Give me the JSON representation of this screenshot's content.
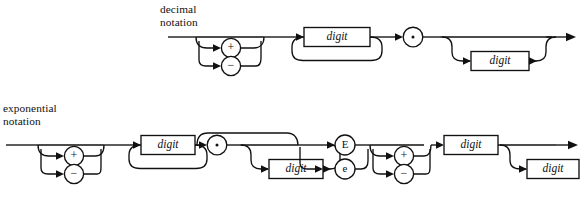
{
  "figure": {
    "type": "railroad-syntax-diagram",
    "line_color": "#111111",
    "background": "#ffffff"
  },
  "diagrams": [
    {
      "id": "decimal",
      "caption": "decimal\nnotation",
      "caption_line1": "decimal",
      "caption_line2": "notation",
      "elements": [
        {
          "kind": "optional-choice",
          "name": "sign",
          "options": [
            "+",
            "−"
          ]
        },
        {
          "kind": "repeat-box",
          "name": "integer-digits",
          "label": "digit",
          "loop": "below"
        },
        {
          "kind": "terminal-circle",
          "name": "decimal-point",
          "label": "·"
        },
        {
          "kind": "optional-repeat-box",
          "name": "fraction-digits",
          "label": "digit",
          "loop": "around"
        }
      ]
    },
    {
      "id": "exponential",
      "caption": "exponential\nnotation",
      "caption_line1": "exponential",
      "caption_line2": "notation",
      "elements": [
        {
          "kind": "optional-choice",
          "name": "mantissa-sign",
          "options": [
            "+",
            "−"
          ]
        },
        {
          "kind": "repeat-box",
          "name": "mantissa-integer-digits",
          "label": "digit",
          "loop": "below"
        },
        {
          "kind": "optional-group",
          "name": "mantissa-fraction",
          "children": [
            {
              "kind": "terminal-circle",
              "name": "decimal-point",
              "label": "·"
            },
            {
              "kind": "optional-repeat-box",
              "name": "fraction-digits",
              "label": "digit",
              "loop": "around"
            }
          ]
        },
        {
          "kind": "choice",
          "name": "exponent-marker",
          "options": [
            "E",
            "e"
          ]
        },
        {
          "kind": "optional-choice",
          "name": "exponent-sign",
          "options": [
            "+",
            "−"
          ]
        },
        {
          "kind": "repeat-box",
          "name": "exponent-first-digit",
          "label": "digit",
          "loop": "none"
        },
        {
          "kind": "optional-box",
          "name": "exponent-second-digit",
          "label": "digit"
        }
      ]
    }
  ],
  "labels": {
    "digit": "digit",
    "plus": "+",
    "minus": "−",
    "dot": "·",
    "E_upper": "E",
    "E_lower": "e"
  }
}
